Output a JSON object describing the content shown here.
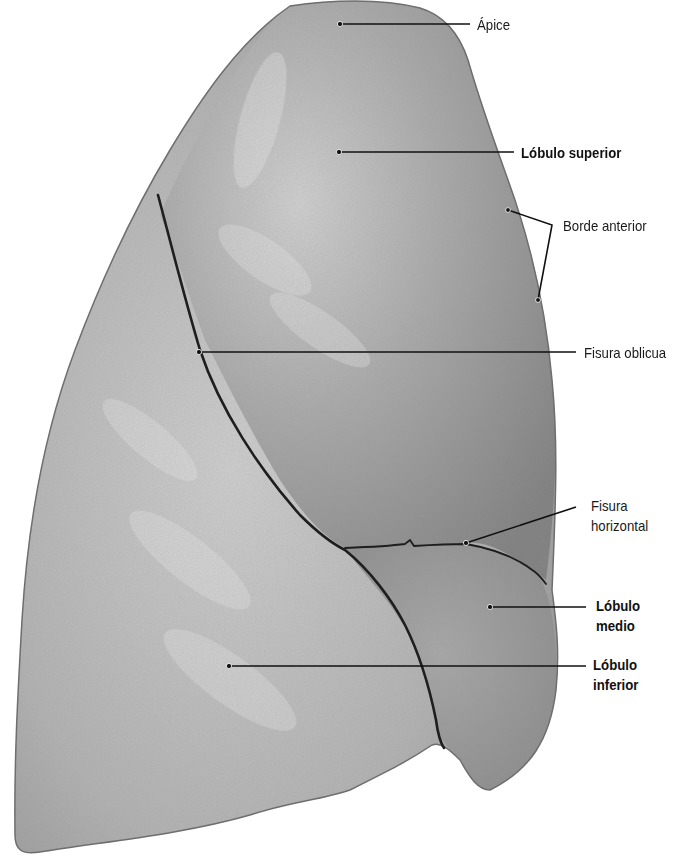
{
  "figure": {
    "colors": {
      "background": "#ffffff",
      "lung_light": "#c9c9c9",
      "lung_mid": "#a6a6a6",
      "lung_dark": "#7d7d7d",
      "fissure": "#1e1e1e",
      "leader": "#111111",
      "text": "#1a1a1a"
    },
    "labels": [
      {
        "id": "apice",
        "text": "Ápice",
        "bold": false
      },
      {
        "id": "lobulo-superior",
        "text": "Lóbulo superior",
        "bold": true
      },
      {
        "id": "borde-anterior",
        "text": "Borde anterior",
        "bold": false
      },
      {
        "id": "fisura-oblicua",
        "text": "Fisura oblicua",
        "bold": false
      },
      {
        "id": "fisura-horizontal",
        "lines": [
          "Fisura",
          "horizontal"
        ],
        "bold": false
      },
      {
        "id": "lobulo-medio",
        "lines": [
          "Lóbulo",
          "medio"
        ],
        "bold": true
      },
      {
        "id": "lobulo-inferior",
        "lines": [
          "Lóbulo",
          "inferior"
        ],
        "bold": true
      }
    ]
  }
}
